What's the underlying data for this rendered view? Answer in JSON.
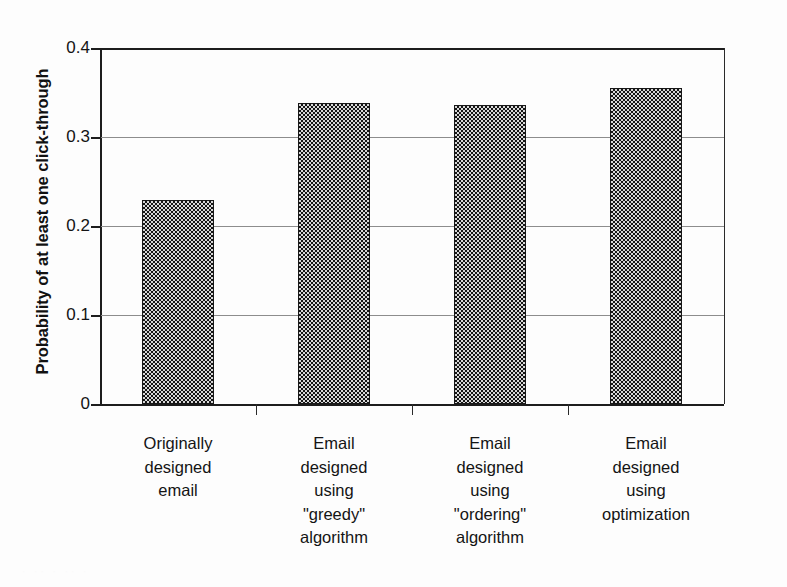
{
  "chart_data": {
    "type": "bar",
    "title": "",
    "xlabel": "",
    "ylabel": "Probability of at least one click-through",
    "ylim": [
      0,
      0.4
    ],
    "ytick_values": [
      0,
      0.1,
      0.2,
      0.3,
      0.4
    ],
    "ytick_labels": [
      "0",
      "0.1",
      "0.2",
      "0.3",
      "0.4"
    ],
    "grid": true,
    "grid_axis": "y",
    "legend": false,
    "legend_position": "none",
    "orientation": "vertical",
    "bar_fill": "checkerboard-dither-gray",
    "bar_edge_color": "#181818",
    "categories": [
      "Originally designed email",
      "Email designed using \"greedy\" algorithm",
      "Email designed using \"ordering\" algorithm",
      "Email designed using optimization"
    ],
    "category_lines": [
      [
        "Originally",
        "designed",
        "email"
      ],
      [
        "Email",
        "designed",
        "using",
        "\"greedy\"",
        "algorithm"
      ],
      [
        "Email",
        "designed",
        "using",
        "\"ordering\"",
        "algorithm"
      ],
      [
        "Email",
        "designed",
        "using",
        "optimization"
      ]
    ],
    "values": [
      0.229,
      0.338,
      0.336,
      0.355
    ],
    "series": [
      {
        "name": "Probability of at least one click-through",
        "values": [
          0.229,
          0.338,
          0.336,
          0.355
        ]
      }
    ]
  },
  "axis": {
    "y_title": "Probability of at least one click-through",
    "ticks": [
      {
        "label": "0.4",
        "value": 0.4
      },
      {
        "label": "0.3",
        "value": 0.3
      },
      {
        "label": "0.2",
        "value": 0.2
      },
      {
        "label": "0.1",
        "value": 0.1
      },
      {
        "label": "0",
        "value": 0
      }
    ]
  },
  "colors": {
    "background": "#fdfdfd",
    "axis": "#1d1d1d",
    "gridline": "#8d8d8d",
    "bar_fill_dark": "#151515",
    "bar_fill_light": "#d8d8d8",
    "text": "#141414"
  },
  "artifact": {
    "bottom_bleed_text": "· ·· · ·· ·"
  }
}
